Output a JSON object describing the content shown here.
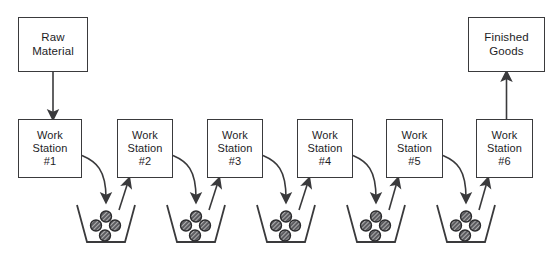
{
  "diagram": {
    "type": "process-flow",
    "background_color": "#ffffff",
    "line_color": "#3a3a3c",
    "text_color": "#1d1d1f",
    "bin_fill_color": "#ffffff",
    "part_fill_color": "#555558"
  },
  "nodes": {
    "raw_material": {
      "label": "Raw\nMaterial",
      "x": 18,
      "y": 17,
      "w": 70,
      "h": 55
    },
    "finished_goods": {
      "label": "Finished\nGoods",
      "x": 468,
      "y": 17,
      "w": 77,
      "h": 55
    }
  },
  "stations": [
    {
      "label": "Work\nStation\n#1",
      "name": "work-station-1",
      "x": 18,
      "y": 119,
      "w": 64,
      "h": 59
    },
    {
      "label": "Work\nStation\n#2",
      "name": "work-station-2",
      "x": 117,
      "y": 119,
      "w": 56,
      "h": 59
    },
    {
      "label": "Work\nStation\n#3",
      "name": "work-station-3",
      "x": 207,
      "y": 119,
      "w": 56,
      "h": 59
    },
    {
      "label": "Work\nStation\n#4",
      "name": "work-station-4",
      "x": 297,
      "y": 119,
      "w": 56,
      "h": 59
    },
    {
      "label": "Work\nStation\n#5",
      "name": "work-station-5",
      "x": 386,
      "y": 119,
      "w": 57,
      "h": 59
    },
    {
      "label": "Work\nStation\n#6",
      "name": "work-station-6",
      "x": 476,
      "y": 119,
      "w": 57,
      "h": 59
    }
  ],
  "bins": [
    {
      "name": "wip-bin-1",
      "cx": 106,
      "parts": 4
    },
    {
      "name": "wip-bin-2",
      "cx": 196,
      "parts": 4
    },
    {
      "name": "wip-bin-3",
      "cx": 286,
      "parts": 4
    },
    {
      "name": "wip-bin-4",
      "cx": 376,
      "parts": 4
    },
    {
      "name": "wip-bin-5",
      "cx": 466,
      "parts": 4
    }
  ],
  "bin_geometry": {
    "top_y": 205,
    "bottom_y": 242,
    "top_half_width": 29,
    "bottom_half_width": 19,
    "part_radius": 5.5
  },
  "connectors": [
    {
      "name": "raw-material-to-station-1",
      "kind": "straight-down"
    },
    {
      "name": "station-1-to-bin-1",
      "kind": "curve-down"
    },
    {
      "name": "bin-1-to-station-2",
      "kind": "diagonal-up"
    },
    {
      "name": "station-2-to-bin-2",
      "kind": "curve-down"
    },
    {
      "name": "bin-2-to-station-3",
      "kind": "diagonal-up"
    },
    {
      "name": "station-3-to-bin-3",
      "kind": "curve-down"
    },
    {
      "name": "bin-3-to-station-4",
      "kind": "diagonal-up"
    },
    {
      "name": "station-4-to-bin-4",
      "kind": "curve-down"
    },
    {
      "name": "bin-4-to-station-5",
      "kind": "diagonal-up"
    },
    {
      "name": "station-5-to-bin-5",
      "kind": "curve-down"
    },
    {
      "name": "bin-5-to-station-6",
      "kind": "diagonal-up"
    },
    {
      "name": "station-6-to-finished-goods",
      "kind": "straight-up"
    }
  ]
}
